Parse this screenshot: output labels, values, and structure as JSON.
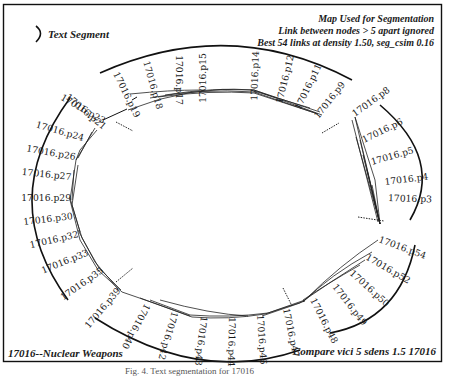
{
  "figure": {
    "legend_label": "Text Segment",
    "header_lines": [
      "Map Used for Segmentation",
      "Link between nodes > 5 apart ignored",
      "Best 54 links at density 1.50, seg_csim 0.16"
    ],
    "bottom_left": "17016--Nuclear Weapons",
    "bottom_right": "Compare vici 5 sdens 1.5 17016",
    "caption": "Fig. 4. Text segmentation for 17016"
  },
  "segments": [
    {
      "name": "segment-top",
      "nodes": [
        "17016.p21",
        "17016.p19",
        "17016.p18",
        "17016.p17",
        "17016.p15",
        "17016.p14",
        "17016.p12",
        "17016.p11",
        "17016.p9"
      ]
    },
    {
      "name": "segment-right",
      "nodes": [
        "17016.p8",
        "17016.p6",
        "17016.p5",
        "17016.p4",
        "17016.p3"
      ]
    },
    {
      "name": "segment-bottom",
      "nodes": [
        "17016.p54",
        "17016.p52",
        "17016.p50",
        "17016.p49",
        "17016.p48",
        "17016.p47",
        "17016.p46",
        "17016.p44",
        "17016.p43",
        "17016.p42",
        "17016.p40",
        "17016.p39"
      ]
    },
    {
      "name": "segment-left",
      "nodes": [
        "17016.p35",
        "17016.p33",
        "17016.p32",
        "17016.p30",
        "17016.p29",
        "17016.p27",
        "17016.p26",
        "17016.p24",
        "17016.p23"
      ]
    }
  ],
  "nodes": {
    "p21": "17016.p21",
    "p19": "17016.p19",
    "p18": "17016.p18",
    "p17": "17016.p17",
    "p15": "17016.p15",
    "p14": "17016.p14",
    "p12": "17016.p12",
    "p11": "17016.p11",
    "p9": "17016.p9",
    "p8": "17016.p8",
    "p6": "17016.p6",
    "p5": "17016.p5",
    "p4": "17016.p4",
    "p3": "17016.p3",
    "p54": "17016.p54",
    "p52": "17016.p52",
    "p50": "17016.p50",
    "p49": "17016.p49",
    "p48": "17016.p48",
    "p47": "17016.p47",
    "p46": "17016.p46",
    "p44": "17016.p44",
    "p43": "17016.p43",
    "p42": "17016.p42",
    "p40": "17016.p40",
    "p39": "17016.p39",
    "p35": "17016.p35",
    "p33": "17016.p33",
    "p32": "17016.p32",
    "p30": "17016.p30",
    "p29": "17016.p29",
    "p27": "17016.p27",
    "p26": "17016.p26",
    "p24": "17016.p24",
    "p23": "17016.p23"
  }
}
